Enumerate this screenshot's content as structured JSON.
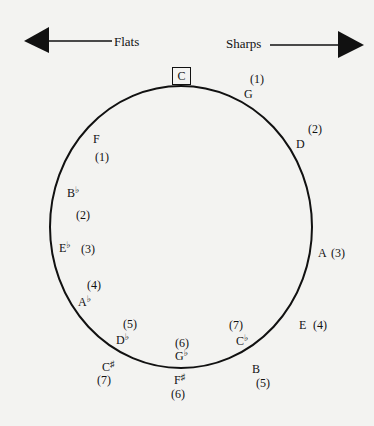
{
  "diagram": {
    "direction_labels": {
      "flats": "Flats",
      "sharps": "Sharps"
    },
    "center_key": "C",
    "sharp_keys": [
      {
        "key": "G",
        "count": "(1)"
      },
      {
        "key": "D",
        "count": "(2)"
      },
      {
        "key": "A",
        "count": "(3)"
      },
      {
        "key": "E",
        "count": "(4)"
      },
      {
        "key": "B",
        "count": "(5)"
      },
      {
        "key": "F",
        "accidental": "♯",
        "count": "(6)"
      },
      {
        "key": "C",
        "accidental": "♯",
        "count": "(7)"
      }
    ],
    "flat_keys": [
      {
        "key": "F",
        "count": "(1)"
      },
      {
        "key": "B",
        "accidental": "♭",
        "count": "(2)"
      },
      {
        "key": "E",
        "accidental": "♭",
        "count": "(3)"
      },
      {
        "key": "A",
        "accidental": "♭",
        "count": "(4)"
      },
      {
        "key": "D",
        "accidental": "♭",
        "count": "(5)"
      },
      {
        "key": "G",
        "accidental": "♭",
        "count": "(6)"
      },
      {
        "key": "C",
        "accidental": "♭",
        "count": "(7)"
      }
    ],
    "colors": {
      "background": "#f3f3f1",
      "ink": "#111111"
    }
  }
}
